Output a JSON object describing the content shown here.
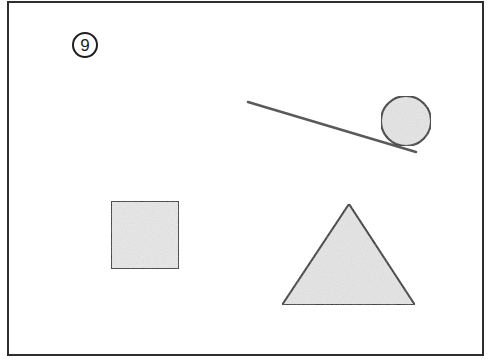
{
  "figure": {
    "label": "9",
    "background": "#ffffff",
    "stroke_color": "#2e2e2e",
    "fill_color": "#e6e6e6",
    "line_color": "#5a5a5a",
    "frame": {
      "x": 8,
      "y": 2,
      "width": 475,
      "height": 353
    },
    "label_badge": {
      "cx": 85,
      "cy": 45,
      "r": 12
    },
    "shapes": {
      "ramp_line": {
        "x1": 248,
        "y1": 102,
        "x2": 416,
        "y2": 152
      },
      "ball": {
        "cx": 406,
        "cy": 121,
        "r": 25
      },
      "square": {
        "x": 111,
        "y": 201,
        "width": 68,
        "height": 68
      },
      "triangle": {
        "points": "349,204 282,305 415,305"
      }
    }
  }
}
